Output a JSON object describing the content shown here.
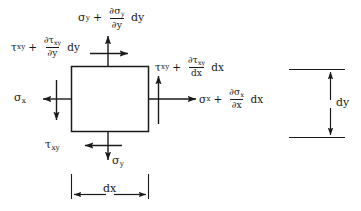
{
  "figure": {
    "name": "stress-element-diagram",
    "colors": {
      "ink": "#1a1a1a",
      "background": "#ffffff"
    },
    "element": {
      "shape": "square",
      "x": 71,
      "y": 66,
      "width": 77,
      "height": 65
    }
  },
  "symbols": {
    "sigma": "σ",
    "tau": "τ",
    "partial": "∂",
    "plus": "+",
    "d_upright": "d",
    "sub_x": "x",
    "sub_y": "y",
    "sub_xy": "xy"
  },
  "labels": {
    "top_normal": {
      "base_symbol": "σ",
      "base_subscript": "y",
      "operator": "+",
      "numerator_symbol": "∂σ",
      "numerator_subscript": "y",
      "denominator_symbol": "∂y",
      "differential": "dy",
      "plain_text": "σy + (∂σy/∂y) dy"
    },
    "top_left_shear": {
      "base_symbol": "τ",
      "base_subscript": "xy",
      "operator": "+",
      "numerator_symbol": "∂τ",
      "numerator_subscript": "xy",
      "denominator_symbol": "∂y",
      "differential": "dy",
      "plain_text": "τxy + (∂τxy/∂y) dy"
    },
    "right_shear": {
      "base_symbol": "τ",
      "base_subscript": "xy",
      "operator": "+",
      "numerator_symbol": "∂τ",
      "numerator_subscript": "xy",
      "denominator_symbol": "dx",
      "differential": "dx",
      "plain_text": "τxy + (∂τxy/dx) dx"
    },
    "right_normal": {
      "base_symbol": "σ",
      "base_subscript": "x",
      "operator": "+",
      "numerator_symbol": "∂σ",
      "numerator_subscript": "x",
      "denominator_symbol": "∂x",
      "differential": "dx",
      "plain_text": "σx + (∂σx/∂x) dx"
    },
    "left_normal": {
      "base_symbol": "σ",
      "base_subscript": "x",
      "plain_text": "σx"
    },
    "bottom_shear": {
      "base_symbol": "τ",
      "base_subscript": "xy",
      "plain_text": "τxy"
    },
    "bottom_normal": {
      "base_symbol": "σ",
      "base_subscript": "y",
      "plain_text": "σy"
    },
    "dim_dx": "dx",
    "dim_dy": "dy"
  },
  "arrows": {
    "top_normal_direction": "up",
    "top_shear_direction": "right",
    "left_normal_direction": "left",
    "left_shear_direction": "down",
    "right_normal_direction": "right",
    "right_shear_direction": "up",
    "bottom_normal_direction": "down",
    "bottom_shear_direction": "left"
  },
  "dimensions": {
    "horizontal": {
      "label": "dx",
      "orientation": "horizontal",
      "style": "double-headed-arrow-with-extension-lines"
    },
    "vertical": {
      "label": "dy",
      "orientation": "vertical",
      "style": "double-headed-arrow-with-extension-lines"
    }
  }
}
